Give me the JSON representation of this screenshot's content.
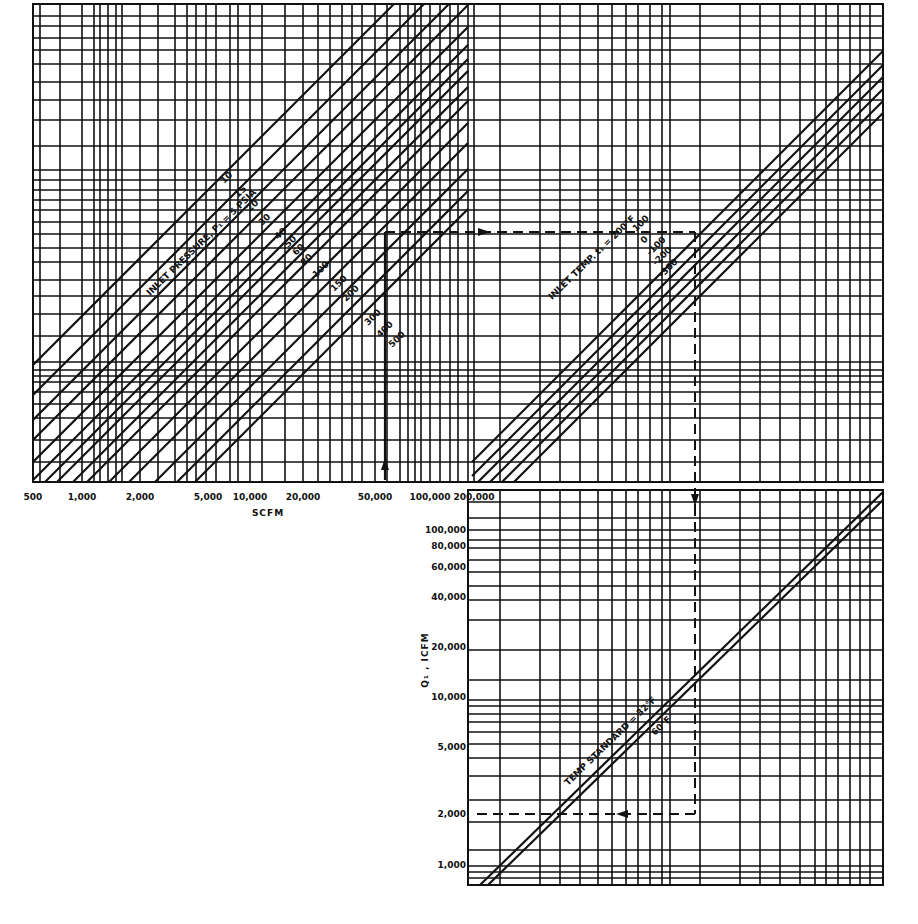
{
  "chart_data": {
    "type": "line",
    "title": "",
    "panels": [
      {
        "name": "inlet-pressure",
        "xlabel": "SCFM",
        "x_ticks": [
          "500",
          "1,000",
          "2,000",
          "5,000",
          "10,000",
          "20,000",
          "50,000",
          "100,000",
          "200,000"
        ],
        "curve_title": "INLET PRESSURE, P₁ = 5 PSIA",
        "series_labels": [
          "5",
          "10",
          "15",
          "20",
          "30",
          "40",
          "50",
          "60",
          "80",
          "100",
          "150",
          "200",
          "300",
          "400",
          "500"
        ]
      },
      {
        "name": "inlet-temperature",
        "curve_title": "INLET TEMP. t₁ = 200°F",
        "series_labels": [
          "200",
          "100",
          "0",
          "-100",
          "-200",
          "-300"
        ]
      },
      {
        "name": "temp-standard",
        "ylabel": "Q₁ , ICFM",
        "y_ticks": [
          "100,000",
          "80,000",
          "60,000",
          "40,000",
          "20,000",
          "10,000",
          "5,000",
          "2,000",
          "1,000"
        ],
        "curve_title": "TEMP STANDARD = 32°F",
        "series_labels": [
          "32°F",
          "60°F"
        ]
      }
    ],
    "example_path": {
      "scfm_start": 60000,
      "icfm_result": 13000
    },
    "grid": true
  },
  "labels": {
    "xlabel": "SCFM",
    "ylabel": "Q₁ , ICFM",
    "pressure_title": "INLET PRESSURE, P₁ = 5 PSIA",
    "temp_title": "INLET TEMP. t₁ = 200°F",
    "std_title": "TEMP STANDARD = 32°F",
    "std_60": "60°F",
    "x_ticks": [
      "500",
      "1,000",
      "2,000",
      "5,000",
      "10,000",
      "20,000",
      "50,000",
      "100,000",
      "200,000"
    ],
    "y_ticks": [
      "100,000",
      "80,000",
      "60,000",
      "40,000",
      "20,000",
      "10,000",
      "5,000",
      "2,000",
      "1,000"
    ],
    "pressure_series": [
      "10",
      "15",
      "20",
      "30",
      "40",
      "50",
      "60",
      "80",
      "100",
      "150",
      "200",
      "300",
      "400",
      "500"
    ],
    "temp_series": [
      "100",
      "0",
      "-100",
      "-200",
      "-300"
    ]
  }
}
